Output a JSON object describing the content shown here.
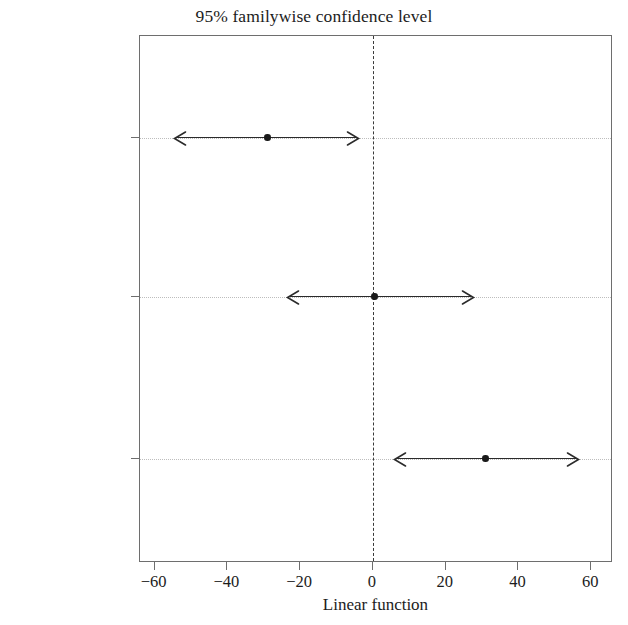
{
  "chart_data": {
    "type": "scatter",
    "title": "95% familywise confidence level",
    "xlabel": "Linear function",
    "ylabel": "",
    "xlim": [
      -64,
      66
    ],
    "xticks": [
      -60,
      -40,
      -20,
      0,
      20,
      40,
      60
    ],
    "xtick_labels": [
      "−60",
      "−40",
      "−20",
      "0",
      "20",
      "40",
      "60"
    ],
    "categories": [
      "96-10–92-10",
      "99-10–92-10",
      "99-10–96-10"
    ],
    "grid": "horizontal-dotted",
    "legend": "none",
    "reference_line": {
      "value": 0,
      "style": "dashed",
      "color": "#3a3a3a"
    },
    "series": [
      {
        "name": "mean difference",
        "values": [
          -29.0,
          0.5,
          31.0
        ]
      },
      {
        "name": "lower confidence limit",
        "values": [
          -55.0,
          -24.0,
          5.5
        ]
      },
      {
        "name": "upper confidence limit",
        "values": [
          -3.5,
          28.0,
          57.0
        ]
      }
    ],
    "intervals": [
      {
        "label": "96-10–92-10",
        "center": -29.0,
        "lower": -55.0,
        "upper": -3.5
      },
      {
        "label": "99-10–92-10",
        "center": 0.5,
        "lower": -24.0,
        "upper": 28.0
      },
      {
        "label": "99-10–96-10",
        "center": 31.0,
        "lower": 5.5,
        "upper": 57.0
      }
    ],
    "colors": {
      "line": "#2b2b2b",
      "point": "#1a1a1a",
      "grid": "#bdbdbd",
      "frame": "#6e6e6e",
      "text": "#1c1c1c"
    }
  }
}
